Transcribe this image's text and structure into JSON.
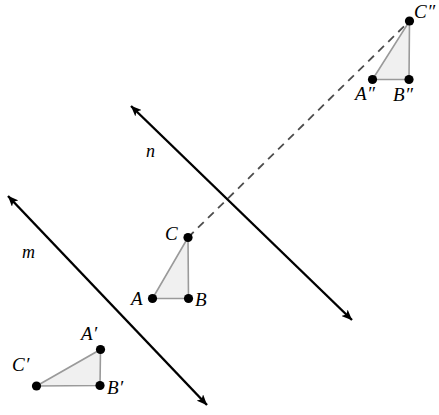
{
  "figure": {
    "canvas": {
      "width": 439,
      "height": 415,
      "background": "#ffffff"
    },
    "style": {
      "triangle_fill": "#f0f0f0",
      "triangle_stroke": "#9a9a9a",
      "vertex_dot_color": "#000000",
      "line_color": "#000000",
      "dashed_color": "#4d4d4d"
    }
  },
  "triangles": [
    {
      "id": "ABC",
      "name": "triangle-abc",
      "fill": "#f0f0f0",
      "stroke": "#9a9a9a",
      "vertices": [
        {
          "label": "A",
          "x": 152.5,
          "y": 298.5,
          "label_x": 131,
          "label_y": 289
        },
        {
          "label": "B",
          "x": 188.5,
          "y": 298.5,
          "label_x": 195,
          "label_y": 290
        },
        {
          "label": "C",
          "x": 188.0,
          "y": 237.5,
          "label_x": 165,
          "label_y": 224
        }
      ]
    },
    {
      "id": "A'B'C'",
      "name": "triangle-a-prime-b-prime-c-prime",
      "fill": "#f0f0f0",
      "stroke": "#9a9a9a",
      "vertices": [
        {
          "label": "A′",
          "x": 100.5,
          "y": 349.5,
          "label_x": 81,
          "label_y": 324
        },
        {
          "label": "B′",
          "x": 100.0,
          "y": 385.5,
          "label_x": 107,
          "label_y": 378
        },
        {
          "label": "C′",
          "x": 36.5,
          "y": 386.0,
          "label_x": 12,
          "label_y": 355
        }
      ]
    },
    {
      "id": "A\"B\"C\"",
      "name": "triangle-a-double-prime-b-double-prime-c-double-prime",
      "fill": "#f0f0f0",
      "stroke": "#9a9a9a",
      "vertices": [
        {
          "label": "A″",
          "x": 372.5,
          "y": 79.5,
          "label_x": 355,
          "label_y": 84
        },
        {
          "label": "B″",
          "x": 409.0,
          "y": 79.5,
          "label_x": 393,
          "label_y": 85
        },
        {
          "label": "C″",
          "x": 409.5,
          "y": 21.0,
          "label_x": 414,
          "label_y": 2
        }
      ]
    }
  ],
  "lines": [
    {
      "id": "m",
      "name": "line-m",
      "label": "m",
      "label_x": 22,
      "label_y": 243,
      "x1": 8,
      "y1": 196,
      "x2": 207,
      "y2": 405,
      "arrow_start": true,
      "arrow_end": true,
      "style": "solid"
    },
    {
      "id": "n",
      "name": "line-n",
      "label": "n",
      "label_x": 146,
      "label_y": 142,
      "x1": 131,
      "y1": 106,
      "x2": 352,
      "y2": 320,
      "arrow_start": true,
      "arrow_end": true,
      "style": "solid"
    }
  ],
  "connectors": [
    {
      "id": "C-to-Cpp",
      "name": "dashed-connector-c-to-c-double-prime",
      "x1": 188.0,
      "y1": 237.5,
      "x2": 409.5,
      "y2": 21.0,
      "style": "dashed",
      "dash_pattern": "8 6"
    }
  ]
}
